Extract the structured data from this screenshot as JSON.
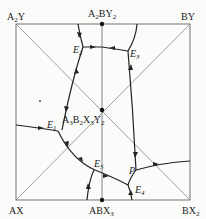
{
  "diagram": {
    "type": "reciprocal salt phase diagram",
    "corners": {
      "top_left": {
        "base": "A",
        "sub1": "2",
        "rest": "Y",
        "sub2": ""
      },
      "top_right": {
        "base": "BY",
        "sub1": "",
        "rest": "",
        "sub2": ""
      },
      "bottom_left": {
        "base": "AX",
        "sub1": "",
        "rest": "",
        "sub2": ""
      },
      "bottom_right": {
        "base": "BX",
        "sub1": "2",
        "rest": "",
        "sub2": ""
      }
    },
    "top_mid": {
      "base": "A",
      "sub1": "2",
      "rest": "BY",
      "sub2": "2"
    },
    "bottom_mid": {
      "base": "ABX",
      "sub1": "3",
      "rest": "",
      "sub2": ""
    },
    "center": {
      "p1": "A",
      "s1": "3",
      "p2": "B",
      "s2": "2",
      "p3": "X",
      "s3": "3",
      "p4": "Y",
      "s4": "2"
    },
    "points": [
      {
        "id": "E1",
        "letter": "E",
        "sub": "1"
      },
      {
        "id": "E2",
        "letter": "E",
        "sub": "2"
      },
      {
        "id": "E3",
        "letter": "E",
        "sub": "3"
      },
      {
        "id": "E4",
        "letter": "E",
        "sub": "4"
      },
      {
        "id": "E5",
        "letter": "E",
        "sub": "5"
      },
      {
        "id": "P",
        "letter": "P",
        "sub": ""
      }
    ],
    "colors": {
      "curve": "#222222",
      "frame": "#666666"
    }
  }
}
